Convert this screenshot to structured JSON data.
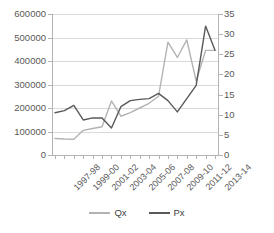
{
  "chart_data": {
    "type": "line",
    "title": "",
    "xlabel": "",
    "ylabel": "",
    "grid": true,
    "legend_position": "bottom",
    "categories": [
      "1997-98",
      "1998-99",
      "1999-00",
      "2000-01",
      "2001-02",
      "2002-03",
      "2003-04",
      "2004-05",
      "2005-06",
      "2006-07",
      "2007-08",
      "2008-09",
      "2009-10",
      "2010-11",
      "2011-12",
      "2012-13",
      "2013-14",
      "2014-15"
    ],
    "visible_tick_labels": [
      "1997-98",
      "1999-00",
      "2001-02",
      "2003-04",
      "2005-06",
      "2007-08",
      "2009-10",
      "2011-12",
      "2013-14"
    ],
    "left_axis": {
      "name": "Qx",
      "ticks": [
        0,
        100000,
        200000,
        300000,
        400000,
        500000,
        600000
      ],
      "tick_labels": [
        "0",
        "100000",
        "200000",
        "300000",
        "400000",
        "500000",
        "600000"
      ],
      "ylim": [
        0,
        600000
      ]
    },
    "right_axis": {
      "name": "Px",
      "ticks": [
        0,
        5,
        10,
        15,
        20,
        25,
        30,
        35
      ],
      "tick_labels": [
        "0",
        "5",
        "10",
        "15",
        "20",
        "25",
        "30",
        "35"
      ],
      "ylim": [
        0,
        35
      ]
    },
    "series": [
      {
        "name": "Qx",
        "axis": "left",
        "color": "#b3b3b3",
        "values": [
          70000,
          68000,
          67000,
          105000,
          113000,
          120000,
          230000,
          165000,
          180000,
          200000,
          220000,
          250000,
          480000,
          415000,
          490000,
          315000,
          445000,
          445000
        ]
      },
      {
        "name": "Px",
        "axis": "right",
        "color": "#595959",
        "values": [
          10.5,
          11.0,
          12.3,
          8.7,
          9.2,
          9.2,
          6.7,
          12.0,
          13.5,
          13.8,
          14.0,
          15.3,
          13.5,
          10.7,
          14.0,
          17.3,
          32.0,
          26.0
        ]
      }
    ],
    "legend": [
      {
        "label": "Qx",
        "color": "#b3b3b3"
      },
      {
        "label": "Px",
        "color": "#595959"
      }
    ]
  }
}
